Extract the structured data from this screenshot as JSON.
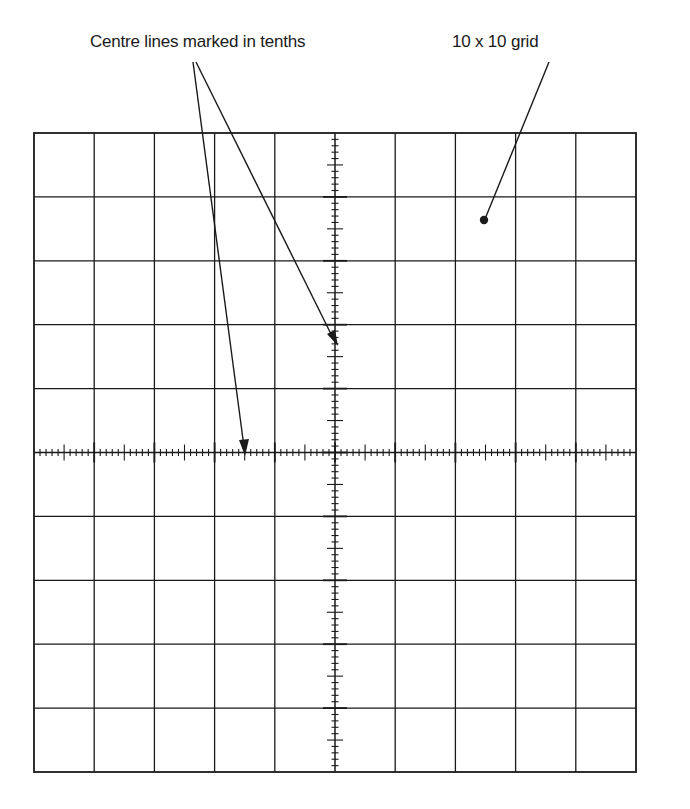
{
  "figure": {
    "labels": {
      "centre_lines": "Centre lines marked in tenths",
      "grid": "10 x 10 grid"
    },
    "grid": {
      "divisions_x": 10,
      "divisions_y": 10,
      "subdivisions_on_centre_lines": 5,
      "left": 34,
      "top": 133,
      "right": 636,
      "bottom": 772
    },
    "colors": {
      "line": "#1a1a1a",
      "background": "#ffffff",
      "faint_text": "#ececec"
    }
  }
}
